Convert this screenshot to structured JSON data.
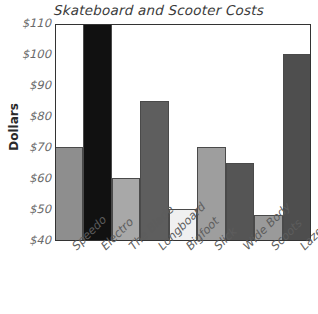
{
  "chart_data": {
    "type": "bar",
    "title": "Skateboard and Scooter Costs",
    "xlabel": "",
    "ylabel": "Dollars",
    "ylim": [
      40,
      110
    ],
    "ytick_step": 10,
    "grid": false,
    "legend": "none",
    "ytick_labels": [
      "$110",
      "$100",
      "$90",
      "$80",
      "$70",
      "$60",
      "$50",
      "$40"
    ],
    "categories": [
      "Speedo",
      "Electro",
      "The Blade",
      "Longboard",
      "Bigfoot",
      "Slick",
      "Wide Body",
      "Scoots",
      "Lazer Liner"
    ],
    "values": [
      70,
      110,
      60,
      85,
      50,
      70,
      65,
      48,
      100
    ],
    "bar_colors": [
      "#8e8e8e",
      "#111111",
      "#a8a8a8",
      "#5e5e5e",
      "#f0f0f0",
      "#9e9e9e",
      "#555555",
      "#9a9a9a",
      "#4e4e4e"
    ]
  }
}
